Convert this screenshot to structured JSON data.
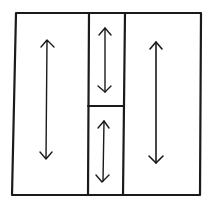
{
  "diagram": {
    "stroke_color": "#1a1a1a",
    "background": "#ffffff",
    "outer_box": {
      "x1": 15,
      "y1": 13,
      "x2": 201,
      "y2": 195
    },
    "middle_column": {
      "left_x": 89,
      "right_x": 124,
      "top_y": 13,
      "bottom_y": 195
    },
    "middle_divider_y": 106,
    "regions": [
      {
        "id": "left-column",
        "arrow": {
          "x": 47,
          "y_top": 41,
          "y_bottom": 158
        }
      },
      {
        "id": "middle-top-cell",
        "arrow": {
          "x": 105,
          "y_top": 28,
          "y_bottom": 92
        }
      },
      {
        "id": "middle-bottom-cell",
        "arrow": {
          "x": 103,
          "y_top": 121,
          "y_bottom": 181
        }
      },
      {
        "id": "right-column",
        "arrow": {
          "x": 156,
          "y_top": 42,
          "y_bottom": 163
        }
      }
    ]
  }
}
